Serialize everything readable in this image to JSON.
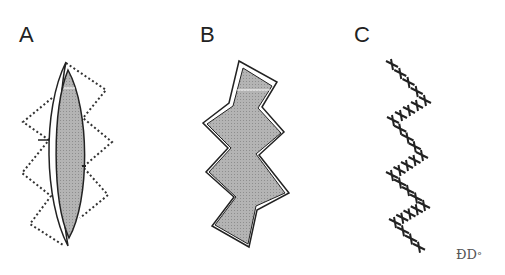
{
  "figure": {
    "panels": [
      {
        "label": "A",
        "description": "lens-shaped shaded flap with dotted zigzag outline"
      },
      {
        "label": "B",
        "description": "zigzag shaded flap with white raised edges"
      },
      {
        "label": "C",
        "description": "zigzag line of sutures"
      }
    ],
    "signature": "ÐD",
    "signature_mark": "°",
    "colors": {
      "fill": "#b0b0b0",
      "stroke": "#222222",
      "background": "#ffffff"
    }
  }
}
